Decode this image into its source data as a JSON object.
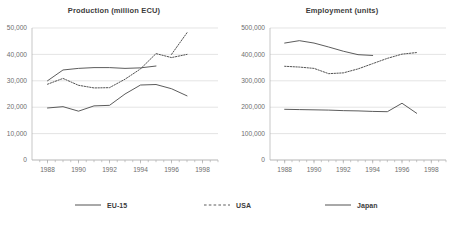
{
  "chart_data": [
    {
      "type": "line",
      "title": "Production (million ECU)",
      "xlabel": "",
      "ylabel": "",
      "xlim": [
        1987,
        1999
      ],
      "ylim": [
        0,
        50000
      ],
      "xticks": [
        1988,
        1990,
        1992,
        1994,
        1996,
        1998
      ],
      "xtick_labels": [
        "1988",
        "1990",
        "1992",
        "1994",
        "1996",
        "1998"
      ],
      "yticks": [
        0,
        10000,
        20000,
        30000,
        40000,
        50000
      ],
      "ytick_labels": [
        "0",
        "10,000",
        "20,000",
        "30,000",
        "40,000",
        "50,000"
      ],
      "grid": "horizontal",
      "legend_position": "bottom-shared",
      "x": [
        1988,
        1989,
        1990,
        1991,
        1992,
        1993,
        1994,
        1995
      ],
      "series": [
        {
          "name": "EU-15",
          "style": "solid",
          "color": "#3f3f3f",
          "x": [
            1988,
            1989,
            1990,
            1991,
            1992,
            1993,
            1994,
            1995
          ],
          "values": [
            30000,
            34100,
            34700,
            35000,
            35000,
            34700,
            34900,
            35600
          ]
        },
        {
          "name": "USA",
          "style": "dotted",
          "color": "#4a4a4a",
          "x": [
            1988,
            1989,
            1990,
            1991,
            1992,
            1993,
            1994,
            1995,
            1996,
            1997
          ],
          "values": [
            28700,
            30900,
            28300,
            27300,
            27400,
            30600,
            34500,
            40300,
            38800,
            40000
          ]
        },
        {
          "name": "USA-extension",
          "style": "dotted",
          "color": "#4a4a4a",
          "x": [
            1996,
            1997
          ],
          "values": [
            40000,
            48200
          ]
        },
        {
          "name": "Japan",
          "style": "solid",
          "color": "#3f3f3f",
          "x": [
            1988,
            1989,
            1990,
            1991,
            1992,
            1993,
            1994,
            1995,
            1996,
            1997
          ],
          "values": [
            19700,
            20200,
            18500,
            20500,
            20700,
            25000,
            28400,
            28600,
            27000,
            24300
          ]
        }
      ]
    },
    {
      "type": "line",
      "title": "Employment (units)",
      "xlabel": "",
      "ylabel": "",
      "xlim": [
        1987,
        1999
      ],
      "ylim": [
        0,
        500000
      ],
      "xticks": [
        1988,
        1990,
        1992,
        1994,
        1996,
        1998
      ],
      "xtick_labels": [
        "1988",
        "1990",
        "1992",
        "1994",
        "1996",
        "1998"
      ],
      "yticks": [
        0,
        100000,
        200000,
        300000,
        400000,
        500000
      ],
      "ytick_labels": [
        "0",
        "100,000",
        "200,000",
        "300,000",
        "400,000",
        "500,000"
      ],
      "grid": "horizontal",
      "legend_position": "bottom-shared",
      "x": [
        1988,
        1989,
        1990,
        1991,
        1992,
        1993,
        1994,
        1995,
        1996,
        1997
      ],
      "series": [
        {
          "name": "EU-15",
          "style": "solid",
          "color": "#3f3f3f",
          "x": [
            1988,
            1989,
            1990,
            1991,
            1992,
            1993,
            1994
          ],
          "values": [
            443000,
            452000,
            443000,
            428000,
            412000,
            399000,
            396000
          ]
        },
        {
          "name": "USA",
          "style": "dotted",
          "color": "#4a4a4a",
          "x": [
            1988,
            1989,
            1990,
            1991,
            1992,
            1993,
            1994,
            1995,
            1996,
            1997
          ],
          "values": [
            355000,
            352000,
            347000,
            327000,
            330000,
            345000,
            365000,
            385000,
            401000,
            407000
          ]
        },
        {
          "name": "Japan",
          "style": "solid",
          "color": "#3f3f3f",
          "x": [
            1988,
            1989,
            1990,
            1991,
            1992,
            1993,
            1994,
            1995,
            1996,
            1997
          ],
          "values": [
            192000,
            191000,
            190000,
            189000,
            187000,
            186000,
            184000,
            183000,
            215000,
            177000
          ]
        }
      ]
    }
  ],
  "legend": {
    "items": [
      {
        "label": "EU-15",
        "style": "solid",
        "icon": "solid-line-icon"
      },
      {
        "label": "USA",
        "style": "dashed",
        "icon": "dashed-line-icon"
      },
      {
        "label": "Japan",
        "style": "solid",
        "icon": "solid-line-icon"
      }
    ]
  }
}
